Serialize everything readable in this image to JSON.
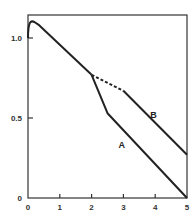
{
  "chart_data": {
    "type": "line",
    "title": "",
    "xlabel": "",
    "ylabel": "",
    "xlim": [
      0,
      5
    ],
    "ylim": [
      0,
      1.15
    ],
    "grid": false,
    "legend": "inline labels",
    "x_ticks": [
      "0",
      "1",
      "2",
      "3",
      "4",
      "5"
    ],
    "y_ticks": [
      "0",
      "0.5",
      "1.0"
    ],
    "y_tick_values": [
      0,
      0.5,
      1.0
    ],
    "shared_segment": {
      "x": [
        0,
        0.1,
        0.2,
        0.35,
        2.0
      ],
      "y": [
        1.0,
        1.09,
        1.1,
        1.08,
        0.77
      ],
      "style": "solid"
    },
    "series": [
      {
        "name": "A",
        "x": [
          2.0,
          2.5,
          5.0
        ],
        "y": [
          0.77,
          0.53,
          0.0
        ],
        "style": "solid"
      },
      {
        "name": "B",
        "segments": [
          {
            "x": [
              2.0,
              3.0
            ],
            "y": [
              0.77,
              0.67
            ],
            "style": "dashed"
          },
          {
            "x": [
              3.0,
              5.0
            ],
            "y": [
              0.67,
              0.27
            ],
            "style": "solid"
          }
        ]
      }
    ],
    "annotations": [
      {
        "text": "A",
        "x": 2.95,
        "y": 0.31
      },
      {
        "text": "B",
        "x": 3.95,
        "y": 0.5
      }
    ]
  }
}
